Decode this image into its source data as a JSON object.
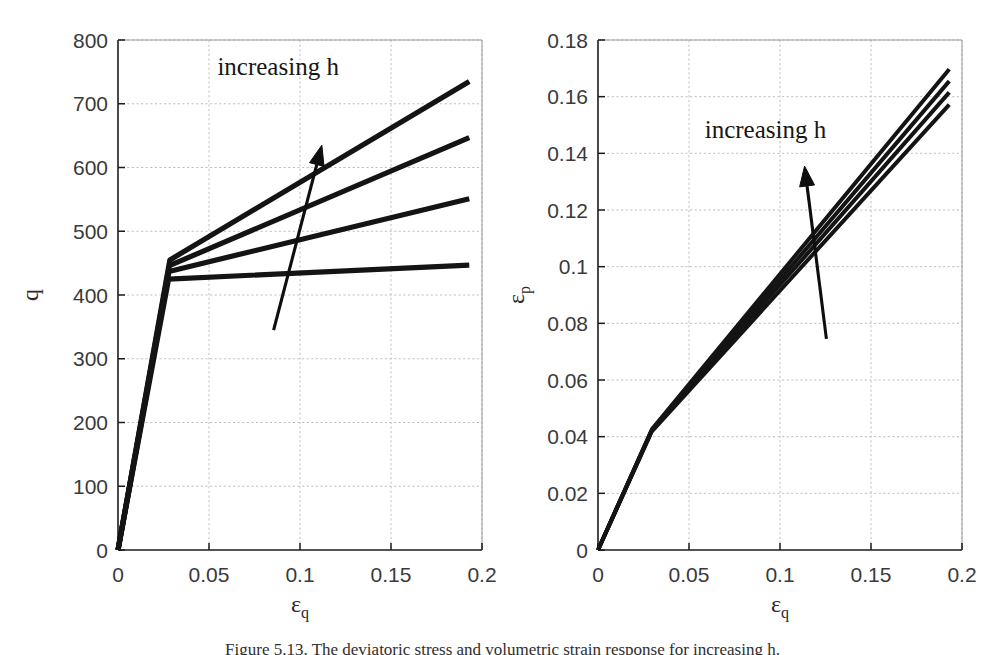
{
  "figure": {
    "caption": "Figure 5.13. The deviatoric stress and volumetric strain response for increasing h.",
    "annotation_label": "increasing h",
    "line_color": "#141414",
    "grid_color": "#b9b9bd",
    "axis_color": "#1c1c1c"
  },
  "chart_data": [
    {
      "type": "line",
      "panel": "left",
      "title": "",
      "xlabel": "εq",
      "xlabel_base": "ε",
      "xlabel_sub": "q",
      "ylabel": "q",
      "xlim": [
        0,
        0.2
      ],
      "ylim": [
        0,
        800
      ],
      "xticks": [
        0,
        0.05,
        0.1,
        0.15,
        0.2
      ],
      "xticklabels": [
        "0",
        "0.05",
        "0.1",
        "0.15",
        "0.2"
      ],
      "yticks": [
        0,
        100,
        200,
        300,
        400,
        500,
        600,
        700,
        800
      ],
      "yticklabels": [
        "0",
        "100",
        "200",
        "300",
        "400",
        "500",
        "600",
        "700",
        "800"
      ],
      "grid": true,
      "legend": "none",
      "annotations": [
        {
          "text": "increasing h",
          "x": 0.088,
          "y": 745,
          "arrow_from": [
            0.0855,
            345
          ],
          "arrow_to": [
            0.112,
            635
          ]
        }
      ],
      "series": [
        {
          "name": "h1",
          "x": [
            0,
            0.0278,
            0.193
          ],
          "values": [
            0,
            425,
            447
          ]
        },
        {
          "name": "h2",
          "x": [
            0,
            0.028,
            0.193
          ],
          "values": [
            0,
            437,
            551
          ]
        },
        {
          "name": "h3",
          "x": [
            0,
            0.0282,
            0.193
          ],
          "values": [
            0,
            446,
            647
          ]
        },
        {
          "name": "h4",
          "x": [
            0,
            0.0285,
            0.193
          ],
          "values": [
            0,
            455,
            735
          ]
        }
      ]
    },
    {
      "type": "line",
      "panel": "right",
      "title": "",
      "xlabel": "εq",
      "xlabel_base": "ε",
      "xlabel_sub": "q",
      "ylabel": "εp",
      "ylabel_base": "ε",
      "ylabel_sub": "p",
      "xlim": [
        0,
        0.2
      ],
      "ylim": [
        0,
        0.18
      ],
      "xticks": [
        0,
        0.05,
        0.1,
        0.15,
        0.2
      ],
      "xticklabels": [
        "0",
        "0.05",
        "0.1",
        "0.15",
        "0.2"
      ],
      "yticks": [
        0,
        0.02,
        0.04,
        0.06,
        0.08,
        0.1,
        0.12,
        0.14,
        0.16,
        0.18
      ],
      "yticklabels": [
        "0",
        "0.02",
        "0.04",
        "0.06",
        "0.08",
        "0.1",
        "0.12",
        "0.14",
        "0.16",
        "0.18"
      ],
      "grid": true,
      "legend": "none",
      "annotations": [
        {
          "text": "increasing h",
          "x": 0.092,
          "y": 0.1455,
          "arrow_from": [
            0.1255,
            0.0745
          ],
          "arrow_to": [
            0.1135,
            0.1355
          ]
        }
      ],
      "series": [
        {
          "name": "h1",
          "x": [
            0,
            0.0295,
            0.193
          ],
          "values": [
            0,
            0.0418,
            0.1572
          ]
        },
        {
          "name": "h2",
          "x": [
            0,
            0.0295,
            0.193
          ],
          "values": [
            0,
            0.0421,
            0.1615
          ]
        },
        {
          "name": "h3",
          "x": [
            0,
            0.0296,
            0.193
          ],
          "values": [
            0,
            0.0424,
            0.1655
          ]
        },
        {
          "name": "h4",
          "x": [
            0,
            0.0297,
            0.193
          ],
          "values": [
            0,
            0.0427,
            0.1697
          ]
        }
      ]
    }
  ]
}
